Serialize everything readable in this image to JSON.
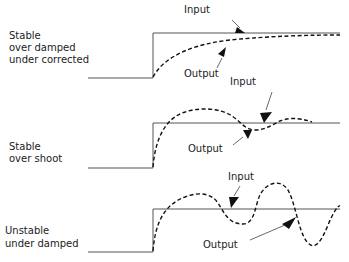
{
  "panels": [
    {
      "id": "overdamped",
      "label_lines": [
        "Stable",
        "over damped",
        "under corrected"
      ],
      "input_label": "Input",
      "output_label": "Output"
    },
    {
      "id": "overshoot",
      "label_lines": [
        "Stable",
        "over shoot"
      ],
      "input_label": "Input",
      "output_label": "Output"
    },
    {
      "id": "underdamped",
      "label_lines": [
        "Unstable",
        "under damped"
      ],
      "input_label": "Input",
      "output_label": "Output"
    }
  ],
  "colors": {
    "input_line": "#555555",
    "output_line": "#111111",
    "text": "#222222"
  }
}
